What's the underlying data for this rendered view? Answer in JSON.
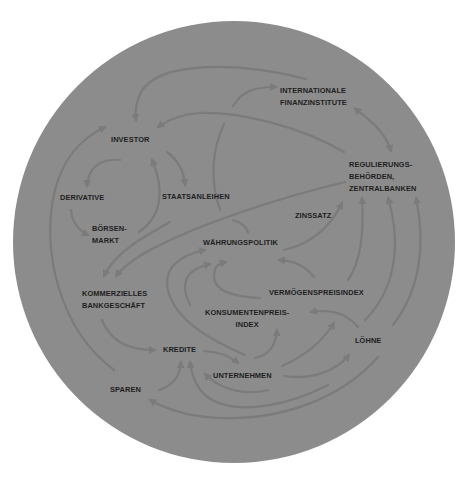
{
  "diagram": {
    "language": "de",
    "background_color": "#ffffff",
    "circle_color": "#8c8c8c",
    "arrow_color": "#7b7b7b",
    "text_color": "#1e1e1e",
    "nodes": {
      "investor": {
        "label": "INVESTOR"
      },
      "internationale_finanzinstitute": {
        "label": "INTERNATIONALE\nFINANZINSTITUTE"
      },
      "regulierungsbehoerden": {
        "label": "REGULIERUNGS-\nBEHÖRDEN,\nZENTRALBANKEN"
      },
      "derivative": {
        "label": "DERIVATIVE"
      },
      "staatsanleihen": {
        "label": "STAATSANLEIHEN"
      },
      "boersenmarkt": {
        "label": "BÖRSEN-\nMARKT"
      },
      "zinssatz": {
        "label": "ZINSSATZ"
      },
      "waehrungspolitik": {
        "label": "WÄHRUNGSPOLITIK"
      },
      "kommerzielles_bankgeschaeft": {
        "label": "KOMMERZIELLES\nBANKGESCHÄFT"
      },
      "vermoegenspreisindex": {
        "label": "VERMÖGENSPREISINDEX"
      },
      "konsumentenpreisindex": {
        "label": "KONSUMENTENPREIS-\nINDEX"
      },
      "kredite": {
        "label": "KREDITE"
      },
      "loehne": {
        "label": "LÖHNE"
      },
      "unternehmen": {
        "label": "UNTERNEHMEN"
      },
      "sparen": {
        "label": "SPAREN"
      }
    },
    "edges": [
      {
        "from": "regulierungsbehoerden",
        "to": "investor"
      },
      {
        "from": "internationale_finanzinstitute",
        "to": "investor"
      },
      {
        "from": "staatsanleihen",
        "to": "internationale_finanzinstitute"
      },
      {
        "from": "internationale_finanzinstitute",
        "to": "regulierungsbehoerden",
        "bidirectional": true
      },
      {
        "from": "investor",
        "to": "derivative"
      },
      {
        "from": "investor",
        "to": "staatsanleihen"
      },
      {
        "from": "boersenmarkt",
        "to": "investor"
      },
      {
        "from": "derivative",
        "to": "boersenmarkt"
      },
      {
        "from": "sparen",
        "to": "investor"
      },
      {
        "from": "regulierungsbehoerden",
        "to": "kommerzielles_bankgeschaeft"
      },
      {
        "from": "boersenmarkt",
        "to": "kommerzielles_bankgeschaeft"
      },
      {
        "from": "waehrungspolitik",
        "to": "zinssatz"
      },
      {
        "from": "zinssatz",
        "to": "regulierungsbehoerden"
      },
      {
        "from": "vermoegenspreisindex",
        "to": "waehrungspolitik"
      },
      {
        "from": "vermoegenspreisindex",
        "to": "regulierungsbehoerden"
      },
      {
        "from": "loehne",
        "to": "regulierungsbehoerden"
      },
      {
        "from": "unternehmen",
        "to": "waehrungspolitik"
      },
      {
        "from": "kommerzielles_bankgeschaeft",
        "to": "kredite"
      },
      {
        "from": "kredite",
        "to": "unternehmen"
      },
      {
        "from": "unternehmen",
        "to": "konsumentenpreisindex"
      },
      {
        "from": "unternehmen",
        "to": "vermoegenspreisindex"
      },
      {
        "from": "unternehmen",
        "to": "loehne"
      },
      {
        "from": "loehne",
        "to": "konsumentenpreisindex"
      },
      {
        "from": "loehne",
        "to": "sparen"
      },
      {
        "from": "sparen",
        "to": "kredite"
      },
      {
        "from": "loehne",
        "to": "kredite"
      },
      {
        "from": "unternehmen",
        "to": "kredite"
      }
    ]
  }
}
